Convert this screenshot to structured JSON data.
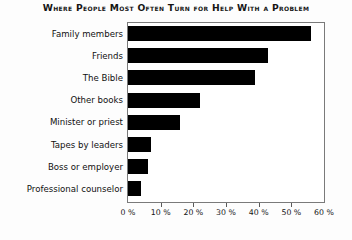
{
  "chart_data": {
    "type": "bar",
    "orientation": "horizontal",
    "title": "Where People Most Often Turn for Help With a Problem",
    "xlabel": "",
    "ylabel": "",
    "xlim": [
      0,
      60
    ],
    "grid": false,
    "legend": null,
    "bar_color": "#000000",
    "categories": [
      "Family members",
      "Friends",
      "The Bible",
      "Other books",
      "Minister or priest",
      "Tapes by leaders",
      "Boss or employer",
      "Professional counselor"
    ],
    "values": [
      56,
      43,
      39,
      22,
      16,
      7,
      6,
      4
    ],
    "xticks": [
      0,
      10,
      20,
      30,
      40,
      50,
      60
    ],
    "xticklabels": [
      "0 %",
      "10 %",
      "20 %",
      "30 %",
      "40 %",
      "50 %",
      "60 %"
    ]
  }
}
